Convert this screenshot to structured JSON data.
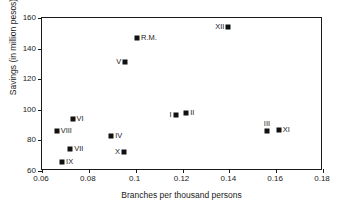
{
  "chart_data": {
    "type": "scatter",
    "title": "",
    "xlabel": "Branches per thousand persons",
    "ylabel": "Savings (in million pesos)",
    "xlim": [
      0.06,
      0.18
    ],
    "ylim": [
      60,
      160
    ],
    "xticks": [
      "0.06",
      "0.08",
      "0.1",
      "0.12",
      "0.14",
      "0.16",
      "0.18"
    ],
    "xtick_values": [
      0.06,
      0.08,
      0.1,
      0.12,
      0.14,
      0.16,
      0.18
    ],
    "yticks": [
      "60",
      "80",
      "100",
      "120",
      "140",
      "160"
    ],
    "ytick_values": [
      60,
      80,
      100,
      120,
      140,
      160
    ],
    "grid": false,
    "legend": "none",
    "marker": "filled-square",
    "marker_color": "#111111",
    "points": [
      {
        "label": "VIII",
        "x": 0.0667,
        "y": 85.5,
        "label_pos": "right"
      },
      {
        "label": "VI",
        "x": 0.0735,
        "y": 93.5,
        "label_pos": "right"
      },
      {
        "label": "VII",
        "x": 0.0725,
        "y": 74.0,
        "label_pos": "right"
      },
      {
        "label": "IX",
        "x": 0.069,
        "y": 65.5,
        "label_pos": "right"
      },
      {
        "label": "IV",
        "x": 0.09,
        "y": 82.5,
        "label_pos": "right"
      },
      {
        "label": "X",
        "x": 0.0955,
        "y": 71.5,
        "label_pos": "left"
      },
      {
        "label": "V",
        "x": 0.096,
        "y": 130.5,
        "label_pos": "left"
      },
      {
        "label": "R.M.",
        "x": 0.101,
        "y": 146.0,
        "label_pos": "right"
      },
      {
        "label": "I",
        "x": 0.1175,
        "y": 96.0,
        "label_pos": "left"
      },
      {
        "label": "II",
        "x": 0.122,
        "y": 97.5,
        "label_pos": "right"
      },
      {
        "label": "XII",
        "x": 0.14,
        "y": 153.5,
        "label_pos": "left"
      },
      {
        "label": "III",
        "x": 0.1565,
        "y": 85.5,
        "label_pos": "above"
      },
      {
        "label": "XI",
        "x": 0.1615,
        "y": 86.0,
        "label_pos": "right"
      }
    ]
  }
}
